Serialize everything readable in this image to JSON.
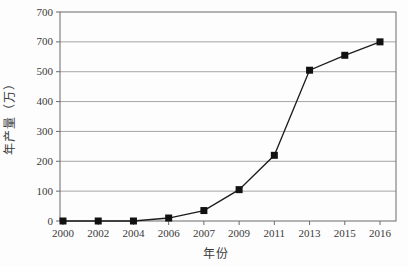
{
  "figure": {
    "xlabel": "年份",
    "ylabel": "年产量（万）"
  },
  "chart_data": {
    "type": "line",
    "categories": [
      "2000",
      "2002",
      "2004",
      "2006",
      "2007",
      "2009",
      "2011",
      "2013",
      "2015",
      "2016"
    ],
    "values": [
      0,
      0,
      0,
      10,
      35,
      105,
      220,
      505,
      555,
      600
    ],
    "series_name": "年产量",
    "title": "",
    "xlabel": "年份",
    "ylabel": "年产量（万）",
    "ylim": [
      0,
      700
    ],
    "yticks": [
      0,
      100,
      200,
      300,
      400,
      500,
      600,
      700
    ],
    "ytick_labels_top_to_bottom": [
      "700",
      "700",
      "500",
      "400",
      "300",
      "200",
      "100",
      "0"
    ],
    "grid": "horizontal",
    "legend": "none",
    "marker": "filled-square",
    "line_color": "#1c1c1c",
    "marker_color": "#111111",
    "grid_color": "#8f8f8f",
    "frame_color": "#6b6b6b",
    "text_color": "#3a3a3a",
    "background_color": "#fdfdfd"
  }
}
